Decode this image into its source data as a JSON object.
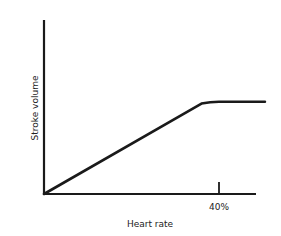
{
  "chart_data": {
    "type": "line",
    "title": "",
    "xlabel": "Heart rate",
    "ylabel": "Stroke volume",
    "x_ticks": [
      {
        "value": 40,
        "label": "40%"
      }
    ],
    "xlim": [
      0,
      48.5
    ],
    "ylim": [
      0,
      100
    ],
    "grid": false,
    "legend": null,
    "series": [
      {
        "name": "Stroke volume",
        "x": [
          0,
          36,
          38,
          40,
          50.5
        ],
        "y": [
          0,
          52,
          53,
          53,
          53
        ]
      }
    ],
    "annotations": [
      "Linear rise to plateau at ~40% heart rate"
    ]
  },
  "colors": {
    "line": "#1a1a1a",
    "axis": "#1a1a1a",
    "background": "#ffffff"
  }
}
